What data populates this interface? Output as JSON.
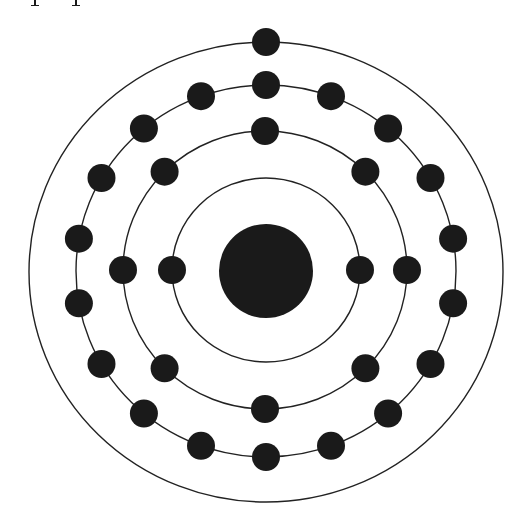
{
  "diagram": {
    "type": "bohr-atom-model",
    "colors": {
      "background": "#ffffff",
      "stroke": "#222222",
      "particle": "#1a1a1a"
    },
    "cut_off_text_fragment": "p p",
    "nucleus": {
      "cx": 266,
      "cy": 271,
      "r": 47
    },
    "electron_radius": 14,
    "shells": [
      {
        "name": "shell-1",
        "cx": 266,
        "cy": 270,
        "rx": 94,
        "ry": 92,
        "electron_count": 2,
        "electron_angles_deg": [
          90,
          270
        ]
      },
      {
        "name": "shell-2",
        "cx": 265,
        "cy": 270,
        "rx": 142,
        "ry": 139,
        "electron_count": 8,
        "electron_angles_deg": [
          0,
          45,
          90,
          135,
          180,
          225,
          270,
          315
        ]
      },
      {
        "name": "shell-3",
        "cx": 266,
        "cy": 271,
        "rx": 190,
        "ry": 186,
        "electron_count": 18,
        "electron_angles_deg": [
          0,
          20,
          40,
          60,
          80,
          100,
          120,
          140,
          160,
          180,
          200,
          220,
          240,
          260,
          280,
          300,
          320,
          340
        ]
      },
      {
        "name": "shell-4",
        "cx": 266,
        "cy": 272,
        "rx": 237,
        "ry": 230,
        "electron_count": 1,
        "electron_angles_deg": [
          0
        ]
      }
    ],
    "total_electrons": 29
  }
}
